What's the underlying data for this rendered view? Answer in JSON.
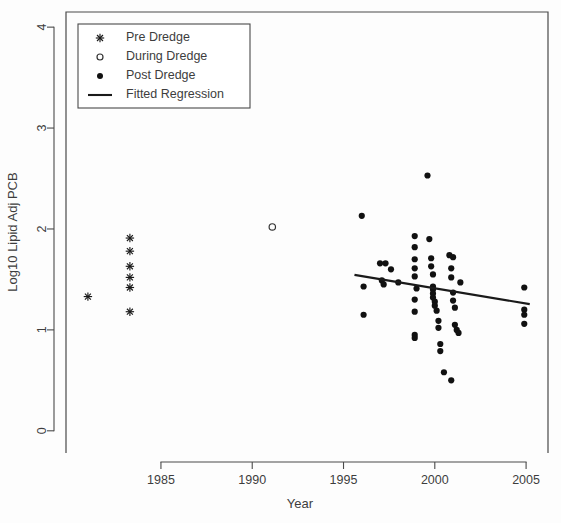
{
  "chart_data": {
    "type": "scatter",
    "title": "",
    "xlabel": "Year",
    "ylabel": "Log10 Lipid Adj PCB",
    "xlim": [
      1979.8,
      2006.2
    ],
    "ylim": [
      -0.22,
      4.15
    ],
    "xticks": [
      1985,
      1990,
      1995,
      2000,
      2005
    ],
    "xticklabels": [
      "1985",
      "1990",
      "1995",
      "2000",
      "2005"
    ],
    "yticks": [
      0,
      1,
      2,
      3,
      4
    ],
    "yticklabels": [
      "0",
      "1",
      "2",
      "3",
      "4"
    ],
    "grid": false,
    "legend_position": "top-left",
    "legend": [
      {
        "label": "Pre Dredge",
        "marker": "asterisk"
      },
      {
        "label": "During Dredge",
        "marker": "open-circle"
      },
      {
        "label": "Post Dredge",
        "marker": "filled-circle"
      },
      {
        "label": "Fitted Regression",
        "marker": "line"
      }
    ],
    "series": [
      {
        "name": "Pre Dredge",
        "marker": "asterisk",
        "points": [
          [
            1981.0,
            1.33
          ],
          [
            1983.3,
            1.91
          ],
          [
            1983.3,
            1.78
          ],
          [
            1983.3,
            1.63
          ],
          [
            1983.3,
            1.52
          ],
          [
            1983.3,
            1.42
          ],
          [
            1983.3,
            1.18
          ]
        ]
      },
      {
        "name": "During Dredge",
        "marker": "open-circle",
        "points": [
          [
            1991.1,
            2.02
          ]
        ]
      },
      {
        "name": "Post Dredge",
        "marker": "filled-circle",
        "points": [
          [
            1996.0,
            2.13
          ],
          [
            1996.1,
            1.43
          ],
          [
            1996.1,
            1.15
          ],
          [
            1997.0,
            1.66
          ],
          [
            1997.3,
            1.66
          ],
          [
            1997.1,
            1.49
          ],
          [
            1997.2,
            1.45
          ],
          [
            1997.6,
            1.6
          ],
          [
            1998.0,
            1.47
          ],
          [
            1998.9,
            1.93
          ],
          [
            1998.9,
            1.82
          ],
          [
            1998.9,
            1.7
          ],
          [
            1998.9,
            1.61
          ],
          [
            1998.9,
            1.53
          ],
          [
            1998.9,
            1.3
          ],
          [
            1998.9,
            1.18
          ],
          [
            1998.9,
            0.95
          ],
          [
            1998.9,
            0.92
          ],
          [
            1999.0,
            1.41
          ],
          [
            1999.6,
            2.53
          ],
          [
            1999.7,
            1.9
          ],
          [
            1999.8,
            1.71
          ],
          [
            1999.8,
            1.63
          ],
          [
            1999.9,
            1.55
          ],
          [
            1999.9,
            1.43
          ],
          [
            1999.9,
            1.4
          ],
          [
            1999.9,
            1.36
          ],
          [
            1999.9,
            1.32
          ],
          [
            2000.0,
            1.28
          ],
          [
            2000.0,
            1.24
          ],
          [
            2000.1,
            1.19
          ],
          [
            2000.2,
            1.09
          ],
          [
            2000.2,
            1.02
          ],
          [
            2000.3,
            0.86
          ],
          [
            2000.3,
            0.79
          ],
          [
            2000.5,
            0.58
          ],
          [
            2000.9,
            0.5
          ],
          [
            2000.8,
            1.74
          ],
          [
            2001.0,
            1.72
          ],
          [
            2000.9,
            1.61
          ],
          [
            2000.9,
            1.52
          ],
          [
            2001.0,
            1.37
          ],
          [
            2001.0,
            1.29
          ],
          [
            2001.1,
            1.22
          ],
          [
            2001.1,
            1.05
          ],
          [
            2001.2,
            1.0
          ],
          [
            2001.3,
            0.97
          ],
          [
            2001.4,
            1.47
          ],
          [
            2004.9,
            1.42
          ],
          [
            2004.9,
            1.2
          ],
          [
            2004.9,
            1.15
          ],
          [
            2004.9,
            1.06
          ]
        ]
      }
    ],
    "fitted_regression": {
      "name": "Fitted Regression",
      "x_start": 1995.6,
      "y_start": 1.545,
      "x_end": 2005.2,
      "y_end": 1.255
    }
  }
}
